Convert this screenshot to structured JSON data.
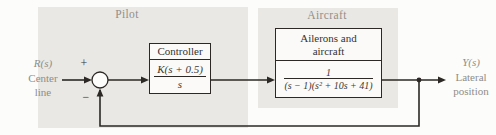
{
  "diagram": {
    "pilot": {
      "label": "Pilot"
    },
    "aircraft": {
      "label": "Aircraft"
    },
    "input": {
      "signal": "R(s)",
      "desc1": "Center",
      "desc2": "line"
    },
    "output": {
      "signal": "Y(s)",
      "desc1": "Lateral",
      "desc2": "position"
    },
    "summing_junction": {
      "plus": "+",
      "minus": "−"
    },
    "controller": {
      "title": "Controller",
      "numerator": "K(s + 0.5)",
      "denominator": "s"
    },
    "plant": {
      "title1": "Ailerons and",
      "title2": "aircraft",
      "numerator": "1",
      "denominator": "(s − 1)(s² + 10s + 41)"
    },
    "colors": {
      "background": "#fcfcfa",
      "region_fill": "#e9e8e4",
      "region_label": "#918f8b",
      "io_label": "#8f8d89",
      "ink": "#2b2825"
    }
  }
}
